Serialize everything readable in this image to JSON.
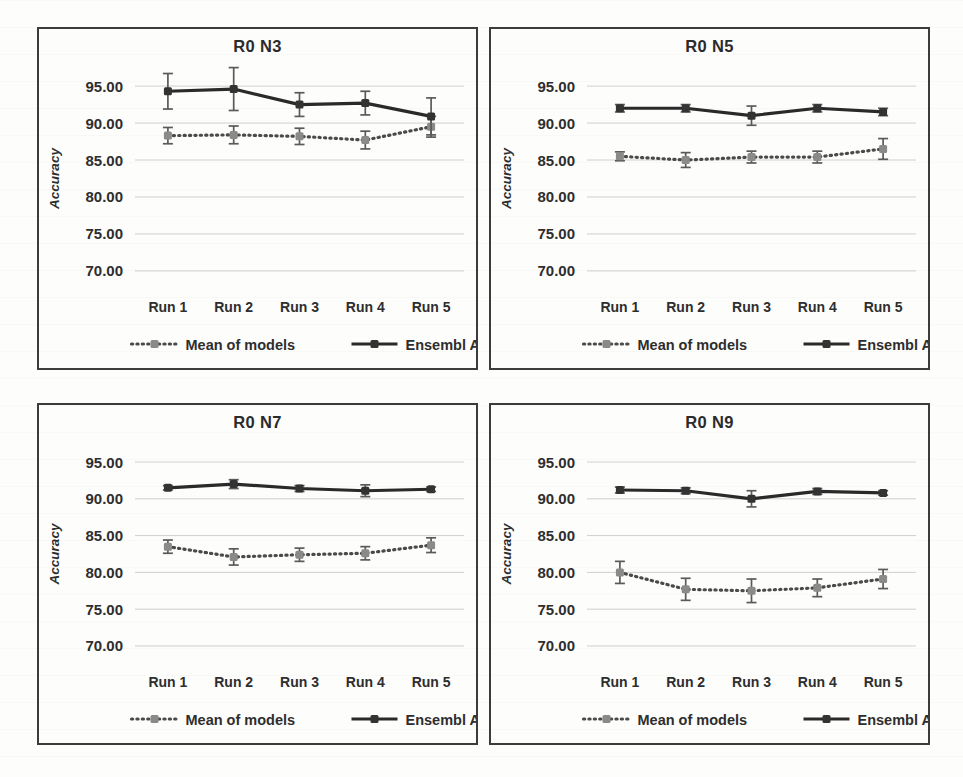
{
  "figure": {
    "panel_count": 4,
    "background_color": "#fdfdfc",
    "panel_border_color": "#3c3c3c"
  },
  "axis": {
    "ylabel": "Accuracy",
    "yticks": [
      "95.00",
      "90.00",
      "85.00",
      "80.00",
      "75.00",
      "70.00"
    ],
    "xticks": [
      "Run 1",
      "Run 2",
      "Run 3",
      "Run 4",
      "Run 5"
    ]
  },
  "legend": {
    "mean_label": "Mean of models",
    "ensemble_label": "Ensembl Acc",
    "mean_color": "#8a8a8a",
    "ensemble_color": "#333333"
  },
  "chart_data": [
    {
      "type": "line",
      "title": "R0 N3",
      "xlabel": "",
      "ylabel": "Accuracy",
      "ylim": [
        68.5,
        96.5
      ],
      "yticks": [
        95,
        90,
        85,
        80,
        75,
        70
      ],
      "grid": true,
      "legend_position": "bottom",
      "categories": [
        "Run 1",
        "Run 2",
        "Run 3",
        "Run 4",
        "Run 5"
      ],
      "series": [
        {
          "name": "Ensembl Acc",
          "values": [
            94.3,
            94.6,
            92.5,
            92.7,
            90.9
          ],
          "errors": [
            2.4,
            2.9,
            1.6,
            1.6,
            2.5
          ]
        },
        {
          "name": "Mean of models",
          "values": [
            88.3,
            88.4,
            88.2,
            87.7,
            89.5
          ],
          "errors": [
            1.1,
            1.2,
            1.1,
            1.2,
            1.4
          ]
        }
      ]
    },
    {
      "type": "line",
      "title": "R0 N5",
      "xlabel": "",
      "ylabel": "Accuracy",
      "ylim": [
        68.5,
        96.5
      ],
      "yticks": [
        95,
        90,
        85,
        80,
        75,
        70
      ],
      "grid": true,
      "legend_position": "bottom",
      "categories": [
        "Run 1",
        "Run 2",
        "Run 3",
        "Run 4",
        "Run 5"
      ],
      "series": [
        {
          "name": "Ensembl Acc",
          "values": [
            92.0,
            92.0,
            91.0,
            92.0,
            91.5
          ],
          "errors": [
            0.5,
            0.5,
            1.3,
            0.5,
            0.5
          ]
        },
        {
          "name": "Mean of models",
          "values": [
            85.5,
            85.0,
            85.4,
            85.4,
            86.5
          ],
          "errors": [
            0.6,
            1.0,
            0.8,
            0.8,
            1.4
          ]
        }
      ]
    },
    {
      "type": "line",
      "title": "R0 N7",
      "xlabel": "",
      "ylabel": "Accuracy",
      "ylim": [
        68.5,
        96.5
      ],
      "yticks": [
        95,
        90,
        85,
        80,
        75,
        70
      ],
      "grid": true,
      "legend_position": "bottom",
      "categories": [
        "Run 1",
        "Run 2",
        "Run 3",
        "Run 4",
        "Run 5"
      ],
      "series": [
        {
          "name": "Ensembl Acc",
          "values": [
            91.5,
            92.0,
            91.4,
            91.1,
            91.3
          ],
          "errors": [
            0.3,
            0.6,
            0.4,
            0.8,
            0.3
          ]
        },
        {
          "name": "Mean of models",
          "values": [
            83.5,
            82.1,
            82.4,
            82.6,
            83.7
          ],
          "errors": [
            0.9,
            1.1,
            0.9,
            0.9,
            1.0
          ]
        }
      ]
    },
    {
      "type": "line",
      "title": "R0 N9",
      "xlabel": "",
      "ylabel": "Accuracy",
      "ylim": [
        68.5,
        96.5
      ],
      "yticks": [
        95,
        90,
        85,
        80,
        75,
        70
      ],
      "grid": true,
      "legend_position": "bottom",
      "categories": [
        "Run 1",
        "Run 2",
        "Run 3",
        "Run 4",
        "Run 5"
      ],
      "series": [
        {
          "name": "Ensembl Acc",
          "values": [
            91.2,
            91.1,
            90.0,
            91.0,
            90.8
          ],
          "errors": [
            0.4,
            0.4,
            1.1,
            0.4,
            0.3
          ]
        },
        {
          "name": "Mean of models",
          "values": [
            80.0,
            77.7,
            77.5,
            77.9,
            79.1
          ],
          "errors": [
            1.5,
            1.5,
            1.6,
            1.2,
            1.3
          ]
        }
      ]
    }
  ]
}
